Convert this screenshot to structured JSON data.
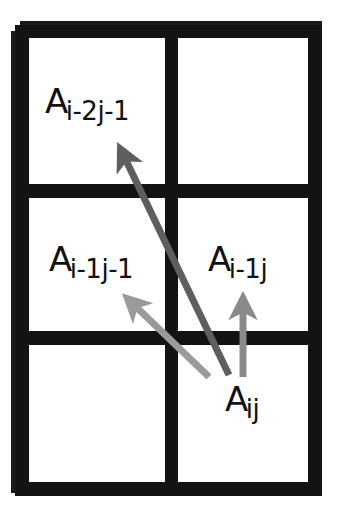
{
  "figure": {
    "canvas": {
      "width": 339,
      "height": 512
    },
    "background_color": "#ffffff",
    "grid_color": "#131313",
    "text_color": "#111111"
  },
  "grid": {
    "rows": 3,
    "cols": 2,
    "border_thickness_px": 14,
    "cells": [
      {
        "row": 0,
        "col": 0,
        "label_base": "A",
        "label_sub": "i-2j-1"
      },
      {
        "row": 0,
        "col": 1,
        "label_base": "",
        "label_sub": ""
      },
      {
        "row": 1,
        "col": 0,
        "label_base": "A",
        "label_sub": "i-1j-1"
      },
      {
        "row": 1,
        "col": 1,
        "label_base": "A",
        "label_sub": "i-1j"
      },
      {
        "row": 2,
        "col": 0,
        "label_base": "",
        "label_sub": ""
      },
      {
        "row": 2,
        "col": 1,
        "label_base": "A",
        "label_sub": "ij"
      }
    ]
  },
  "labels": {
    "a_i2j1": {
      "base": "A",
      "sub": "i-2j-1"
    },
    "a_i1j1": {
      "base": "A",
      "sub": "i-1j-1"
    },
    "a_i1j": {
      "base": "A",
      "sub": "i-1j"
    },
    "a_ij": {
      "base": "A",
      "sub": "ij"
    }
  },
  "arrows": [
    {
      "name": "arrow-to-a-i-2j-1",
      "from": "A ij",
      "to": "A i-2j-1",
      "color": "#5e5e5e",
      "x1": 229,
      "y1": 375,
      "x2": 121,
      "y2": 150,
      "width": 7
    },
    {
      "name": "arrow-to-a-i-1j-1",
      "from": "A ij",
      "to": "A i-1j-1",
      "color": "#9a9a9a",
      "x1": 209,
      "y1": 377,
      "x2": 128,
      "y2": 299,
      "width": 7
    },
    {
      "name": "arrow-to-a-i-1j",
      "from": "A ij",
      "to": "A i-1j",
      "color": "#8a8a8a",
      "x1": 243,
      "y1": 377,
      "x2": 243,
      "y2": 299,
      "width": 7
    }
  ]
}
